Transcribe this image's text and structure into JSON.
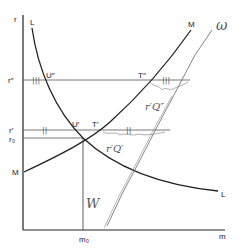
{
  "figure": {
    "axis_labels": {
      "y": "r",
      "x": "m"
    },
    "curve_labels": {
      "L_top": "L",
      "L_bottom": "L",
      "M_top": "M",
      "M_left": "M"
    },
    "levels": {
      "r_double_prime": "r″",
      "r_prime": "r′",
      "r_zero": "r₀"
    },
    "points": {
      "U_double_prime": "U″",
      "T_double_prime": "T″",
      "U_prime": "U′",
      "T_prime": "T′"
    },
    "m_zero": "m₀",
    "handwritten": {
      "w": "ω",
      "w_bottom": "W",
      "gap_upper": "r′Q″",
      "gap_lower": "r′Q′",
      "tick_marks_upper": "|||",
      "tick_marks_lower": "||"
    }
  }
}
